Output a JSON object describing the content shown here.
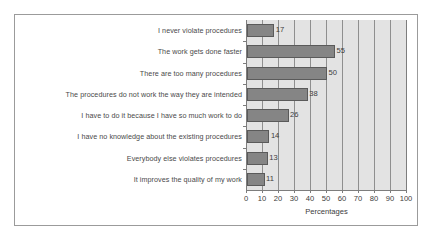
{
  "chart_data": {
    "type": "bar",
    "orientation": "horizontal",
    "title": "",
    "xlabel": "Percentages",
    "ylabel": "",
    "xlim": [
      0,
      100
    ],
    "xticks": [
      0,
      10,
      20,
      30,
      40,
      50,
      60,
      70,
      80,
      90,
      100
    ],
    "grid": true,
    "legend": false,
    "categories": [
      "I never violate procedures",
      "The work gets done faster",
      "There are too many procedures",
      "The procedures do not work the way they are intended",
      "I have to do it because I have so much work to do",
      "I have no knowledge about the existing procedures",
      "Everybody else violates procedures",
      "It improves the quality of my work"
    ],
    "values": [
      17,
      55,
      50,
      38,
      26,
      14,
      13,
      11
    ],
    "data_labels": [
      "17",
      "55",
      "50",
      "38",
      "26",
      "14",
      "13",
      "11"
    ],
    "colors": {
      "bar_fill": "#858585",
      "bar_edge": "#5a5a5a",
      "plot_background": "#e3e3e3",
      "gridline": "#8f8f8f",
      "axis": "#7d7d7d",
      "text": "#3c3c3c",
      "label_text": "#4a4a4a",
      "frame": "#9b9b9b",
      "figure_background": "#ffffff"
    }
  }
}
